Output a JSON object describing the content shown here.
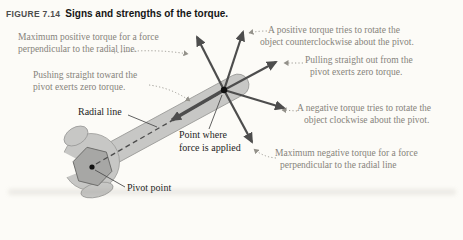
{
  "figure": {
    "label": "FIGURE 7.14",
    "caption": "Signs and strengths of the torque."
  },
  "annotations": {
    "max_positive": {
      "lines": [
        "Maximum positive torque for a force",
        "perpendicular to the radial line."
      ]
    },
    "pushing": {
      "lines": [
        "Pushing straight toward the",
        "pivot exerts zero torque."
      ]
    },
    "positive": {
      "lines": [
        "A positive torque tries to rotate the",
        "object counterclockwise about the pivot."
      ]
    },
    "pulling": {
      "lines": [
        "Pulling straight out from the",
        "pivot exerts zero torque."
      ]
    },
    "negative": {
      "lines": [
        "A negative torque tries to rotate the",
        "object clockwise about the pivot."
      ]
    },
    "max_negative": {
      "lines": [
        "Maximum negative torque for a force",
        "perpendicular to the radial line"
      ]
    }
  },
  "labels": {
    "radial_line": "Radial line",
    "force_point_line1": "Point where",
    "force_point_line2": "force is applied",
    "pivot_point": "Pivot point"
  },
  "colors": {
    "background": "#fcfbf7",
    "arrow": "#4d4d4d",
    "annotation_text": "#86837b",
    "label_text": "#1e1e1e",
    "leader": "#93918a",
    "wrench_fill": "#c7c7c5",
    "wrench_outline": "#9a9a98",
    "nut_fill": "#a7a7a5",
    "dot": "#111111"
  },
  "diagram": {
    "pivot_point": [
      92,
      167
    ],
    "force_point": [
      224,
      90
    ],
    "force_arrows": [
      {
        "name": "max-positive-torque",
        "from": [
          224,
          90
        ],
        "to": [
          197,
          37
        ],
        "width": 2.2
      },
      {
        "name": "positive-torque",
        "from": [
          224,
          90
        ],
        "to": [
          243,
          32
        ],
        "width": 2.2
      },
      {
        "name": "pulling-out",
        "from": [
          224,
          90
        ],
        "to": [
          276,
          62
        ],
        "width": 2.2
      },
      {
        "name": "negative-torque",
        "from": [
          224,
          90
        ],
        "to": [
          284,
          108
        ],
        "width": 2.2
      },
      {
        "name": "max-negative-torque",
        "from": [
          224,
          90
        ],
        "to": [
          252,
          142
        ],
        "width": 2.2
      },
      {
        "name": "pushing-toward-pivot",
        "from": [
          224,
          90
        ],
        "to": [
          172,
          120
        ],
        "width": 3.4
      }
    ]
  }
}
